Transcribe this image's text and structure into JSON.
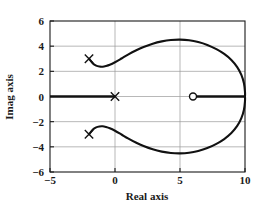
{
  "chart_data": {
    "type": "line",
    "title": "",
    "xlabel": "Real axis",
    "ylabel": "Imag axis",
    "xlim": [
      -5,
      10
    ],
    "ylim": [
      -6,
      6
    ],
    "xticks": [
      -5,
      0,
      5,
      10
    ],
    "xtick_labels": [
      "−5",
      "0",
      "5",
      "10"
    ],
    "yticks": [
      -6,
      -4,
      -2,
      0,
      2,
      4,
      6
    ],
    "ytick_labels": [
      "−6",
      "−4",
      "−2",
      "0",
      "2",
      "4",
      "6"
    ],
    "grid": true,
    "legend": "none",
    "annotations": [
      "Root locus plot",
      "Open-loop poles marked with x",
      "Open-loop zero marked with o"
    ],
    "markers": {
      "poles": [
        {
          "label": "pole-origin",
          "x": 0,
          "y": 0,
          "glyph": "x"
        },
        {
          "label": "pole-upper",
          "x": -2,
          "y": 3,
          "glyph": "x"
        },
        {
          "label": "pole-lower",
          "x": -2,
          "y": -3,
          "glyph": "x"
        }
      ],
      "zeros": [
        {
          "label": "zero-real",
          "x": 6,
          "y": 0,
          "glyph": "o"
        }
      ]
    },
    "real_axis_loci": [
      {
        "name": "left-branch",
        "from_x": -5,
        "to_x": 0,
        "y": 0
      },
      {
        "name": "right-branch",
        "from_x": 6,
        "to_x": 10,
        "y": 0
      }
    ],
    "branches": [
      {
        "name": "upper-branch",
        "points": [
          [
            -2.0,
            3.0
          ],
          [
            -1.7,
            2.62
          ],
          [
            -1.45,
            2.45
          ],
          [
            -1.2,
            2.38
          ],
          [
            -0.95,
            2.37
          ],
          [
            -0.7,
            2.42
          ],
          [
            -0.4,
            2.52
          ],
          [
            0.0,
            2.72
          ],
          [
            0.5,
            3.02
          ],
          [
            1.0,
            3.33
          ],
          [
            1.6,
            3.66
          ],
          [
            2.2,
            3.94
          ],
          [
            2.9,
            4.2
          ],
          [
            3.6,
            4.38
          ],
          [
            4.3,
            4.49
          ],
          [
            5.0,
            4.52
          ],
          [
            5.7,
            4.47
          ],
          [
            6.4,
            4.33
          ],
          [
            7.1,
            4.1
          ],
          [
            7.8,
            3.76
          ],
          [
            8.4,
            3.38
          ],
          [
            8.95,
            2.9
          ],
          [
            9.4,
            2.34
          ],
          [
            9.72,
            1.72
          ],
          [
            9.92,
            1.05
          ],
          [
            10.0,
            0.35
          ],
          [
            10.0,
            0.0
          ]
        ]
      },
      {
        "name": "lower-branch",
        "points": [
          [
            -2.0,
            -3.0
          ],
          [
            -1.7,
            -2.62
          ],
          [
            -1.45,
            -2.45
          ],
          [
            -1.2,
            -2.38
          ],
          [
            -0.95,
            -2.37
          ],
          [
            -0.7,
            -2.42
          ],
          [
            -0.4,
            -2.52
          ],
          [
            0.0,
            -2.72
          ],
          [
            0.5,
            -3.02
          ],
          [
            1.0,
            -3.33
          ],
          [
            1.6,
            -3.66
          ],
          [
            2.2,
            -3.94
          ],
          [
            2.9,
            -4.2
          ],
          [
            3.6,
            -4.38
          ],
          [
            4.3,
            -4.49
          ],
          [
            5.0,
            -4.52
          ],
          [
            5.7,
            -4.47
          ],
          [
            6.4,
            -4.33
          ],
          [
            7.1,
            -4.1
          ],
          [
            7.8,
            -3.76
          ],
          [
            8.4,
            -3.38
          ],
          [
            8.95,
            -2.9
          ],
          [
            9.4,
            -2.34
          ],
          [
            9.72,
            -1.72
          ],
          [
            9.92,
            -1.05
          ],
          [
            10.0,
            -0.35
          ],
          [
            10.0,
            0.0
          ]
        ]
      }
    ]
  },
  "axes": {
    "x_axis_title": "Real axis",
    "y_axis_title": "Imag axis"
  }
}
